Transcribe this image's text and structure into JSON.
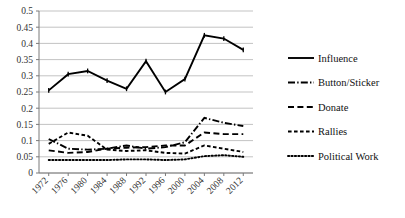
{
  "chart_data": {
    "type": "line",
    "title": "",
    "subtitle": "",
    "xlabel": "",
    "ylabel": "",
    "categories": [
      "1972",
      "1976",
      "1980",
      "1984",
      "1988",
      "1992",
      "1996",
      "2000",
      "2004",
      "2008",
      "2012"
    ],
    "ylim": [
      0,
      0.5
    ],
    "yticks": [
      "0",
      "0.05",
      "0.1",
      "0.15",
      "0.2",
      "0.25",
      "0.3",
      "0.35",
      "0.4",
      "0.45",
      "0.5"
    ],
    "ytick_values": [
      0,
      0.05,
      0.1,
      0.15,
      0.2,
      0.25,
      0.3,
      0.35,
      0.4,
      0.45,
      0.5
    ],
    "grid": "horizontal",
    "legend_position": "right",
    "series": [
      {
        "name": "Influence",
        "style": "solid",
        "color": "#000000",
        "values": [
          0.255,
          0.305,
          0.315,
          0.285,
          0.26,
          0.345,
          0.25,
          0.29,
          0.425,
          0.415,
          0.38
        ]
      },
      {
        "name": "Button/Sticker",
        "style": "dash-dot",
        "color": "#000000",
        "values": [
          0.105,
          0.075,
          0.072,
          0.075,
          0.085,
          0.075,
          0.08,
          0.095,
          0.17,
          0.155,
          0.145
        ]
      },
      {
        "name": "Donate",
        "style": "long-dash",
        "color": "#000000",
        "values": [
          0.07,
          0.062,
          0.065,
          0.075,
          0.078,
          0.08,
          0.085,
          0.085,
          0.125,
          0.12,
          0.12
        ]
      },
      {
        "name": "Rallies",
        "style": "short-dash",
        "color": "#000000",
        "values": [
          0.09,
          0.125,
          0.115,
          0.072,
          0.068,
          0.07,
          0.062,
          0.06,
          0.085,
          0.075,
          0.065
        ]
      },
      {
        "name": "Political Work",
        "style": "dotted",
        "color": "#000000",
        "values": [
          0.04,
          0.04,
          0.04,
          0.04,
          0.042,
          0.042,
          0.04,
          0.042,
          0.052,
          0.055,
          0.05
        ]
      }
    ]
  }
}
